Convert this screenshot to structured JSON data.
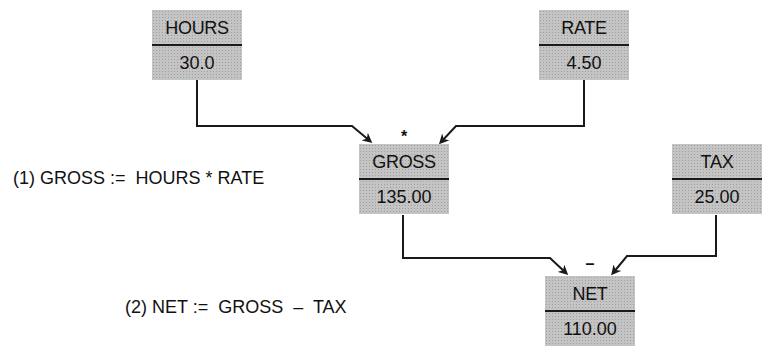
{
  "diagram": {
    "type": "dataflow",
    "colors": {
      "box_fill": "#c4c4c4",
      "line": "#1a1a1a",
      "text": "#111111"
    },
    "variables": {
      "hours": {
        "name": "HOURS",
        "value": "30.0"
      },
      "rate": {
        "name": "RATE",
        "value": "4.50"
      },
      "gross": {
        "name": "GROSS",
        "value": "135.00"
      },
      "tax": {
        "name": "TAX",
        "value": "25.00"
      },
      "net": {
        "name": "NET",
        "value": "110.00"
      }
    },
    "operators": {
      "gross_op": "*",
      "net_op": "–"
    },
    "formulas": [
      {
        "text": "(1) GROSS :=  HOURS * RATE"
      },
      {
        "text": "(2) NET :=  GROSS  –  TAX"
      }
    ],
    "edges": [
      {
        "from": "HOURS",
        "to": "GROSS"
      },
      {
        "from": "RATE",
        "to": "GROSS"
      },
      {
        "from": "GROSS",
        "to": "NET"
      },
      {
        "from": "TAX",
        "to": "NET"
      }
    ]
  }
}
